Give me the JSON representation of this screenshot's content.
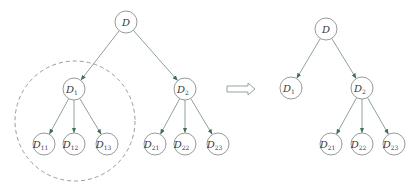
{
  "diagram": {
    "colors": {
      "edge": "#7f998b",
      "arrowhead": "#3f6f55",
      "node_stroke": "#8a8f8c",
      "dashed_outline": "#9a9a9a"
    },
    "left_tree": {
      "nodes": [
        {
          "id": "D",
          "base": "D",
          "sub": "",
          "x": 126,
          "y": 22
        },
        {
          "id": "D1",
          "base": "D",
          "sub": "1",
          "x": 74,
          "y": 89
        },
        {
          "id": "D2",
          "base": "D",
          "sub": "2",
          "x": 185,
          "y": 89
        },
        {
          "id": "D11",
          "base": "D",
          "sub": "11",
          "x": 44,
          "y": 144
        },
        {
          "id": "D12",
          "base": "D",
          "sub": "12",
          "x": 74,
          "y": 144
        },
        {
          "id": "D13",
          "base": "D",
          "sub": "13",
          "x": 107,
          "y": 144
        },
        {
          "id": "D21",
          "base": "D",
          "sub": "21",
          "x": 155,
          "y": 144
        },
        {
          "id": "D22",
          "base": "D",
          "sub": "22",
          "x": 185,
          "y": 144
        },
        {
          "id": "D23",
          "base": "D",
          "sub": "23",
          "x": 218,
          "y": 144
        }
      ],
      "edges": [
        [
          "D",
          "D1"
        ],
        [
          "D",
          "D2"
        ],
        [
          "D1",
          "D11"
        ],
        [
          "D1",
          "D12"
        ],
        [
          "D1",
          "D13"
        ],
        [
          "D2",
          "D21"
        ],
        [
          "D2",
          "D22"
        ],
        [
          "D2",
          "D23"
        ]
      ],
      "highlight": {
        "label": "pruned subtree D1",
        "cx": 75,
        "cy": 121,
        "r": 60
      }
    },
    "transform_arrow": {
      "label": "becomes",
      "x1": 227,
      "x2": 255,
      "y": 89
    },
    "right_tree": {
      "nodes": [
        {
          "id": "D",
          "base": "D",
          "sub": "",
          "x": 326,
          "y": 29
        },
        {
          "id": "D1",
          "base": "D",
          "sub": "1",
          "x": 291,
          "y": 88
        },
        {
          "id": "D2",
          "base": "D",
          "sub": "2",
          "x": 362,
          "y": 88
        },
        {
          "id": "D21",
          "base": "D",
          "sub": "21",
          "x": 331,
          "y": 144
        },
        {
          "id": "D22",
          "base": "D",
          "sub": "22",
          "x": 362,
          "y": 144
        },
        {
          "id": "D23",
          "base": "D",
          "sub": "23",
          "x": 394,
          "y": 144
        }
      ],
      "edges": [
        [
          "D",
          "D1"
        ],
        [
          "D",
          "D2"
        ],
        [
          "D2",
          "D21"
        ],
        [
          "D2",
          "D22"
        ],
        [
          "D2",
          "D23"
        ]
      ]
    },
    "node_radius": 11
  }
}
